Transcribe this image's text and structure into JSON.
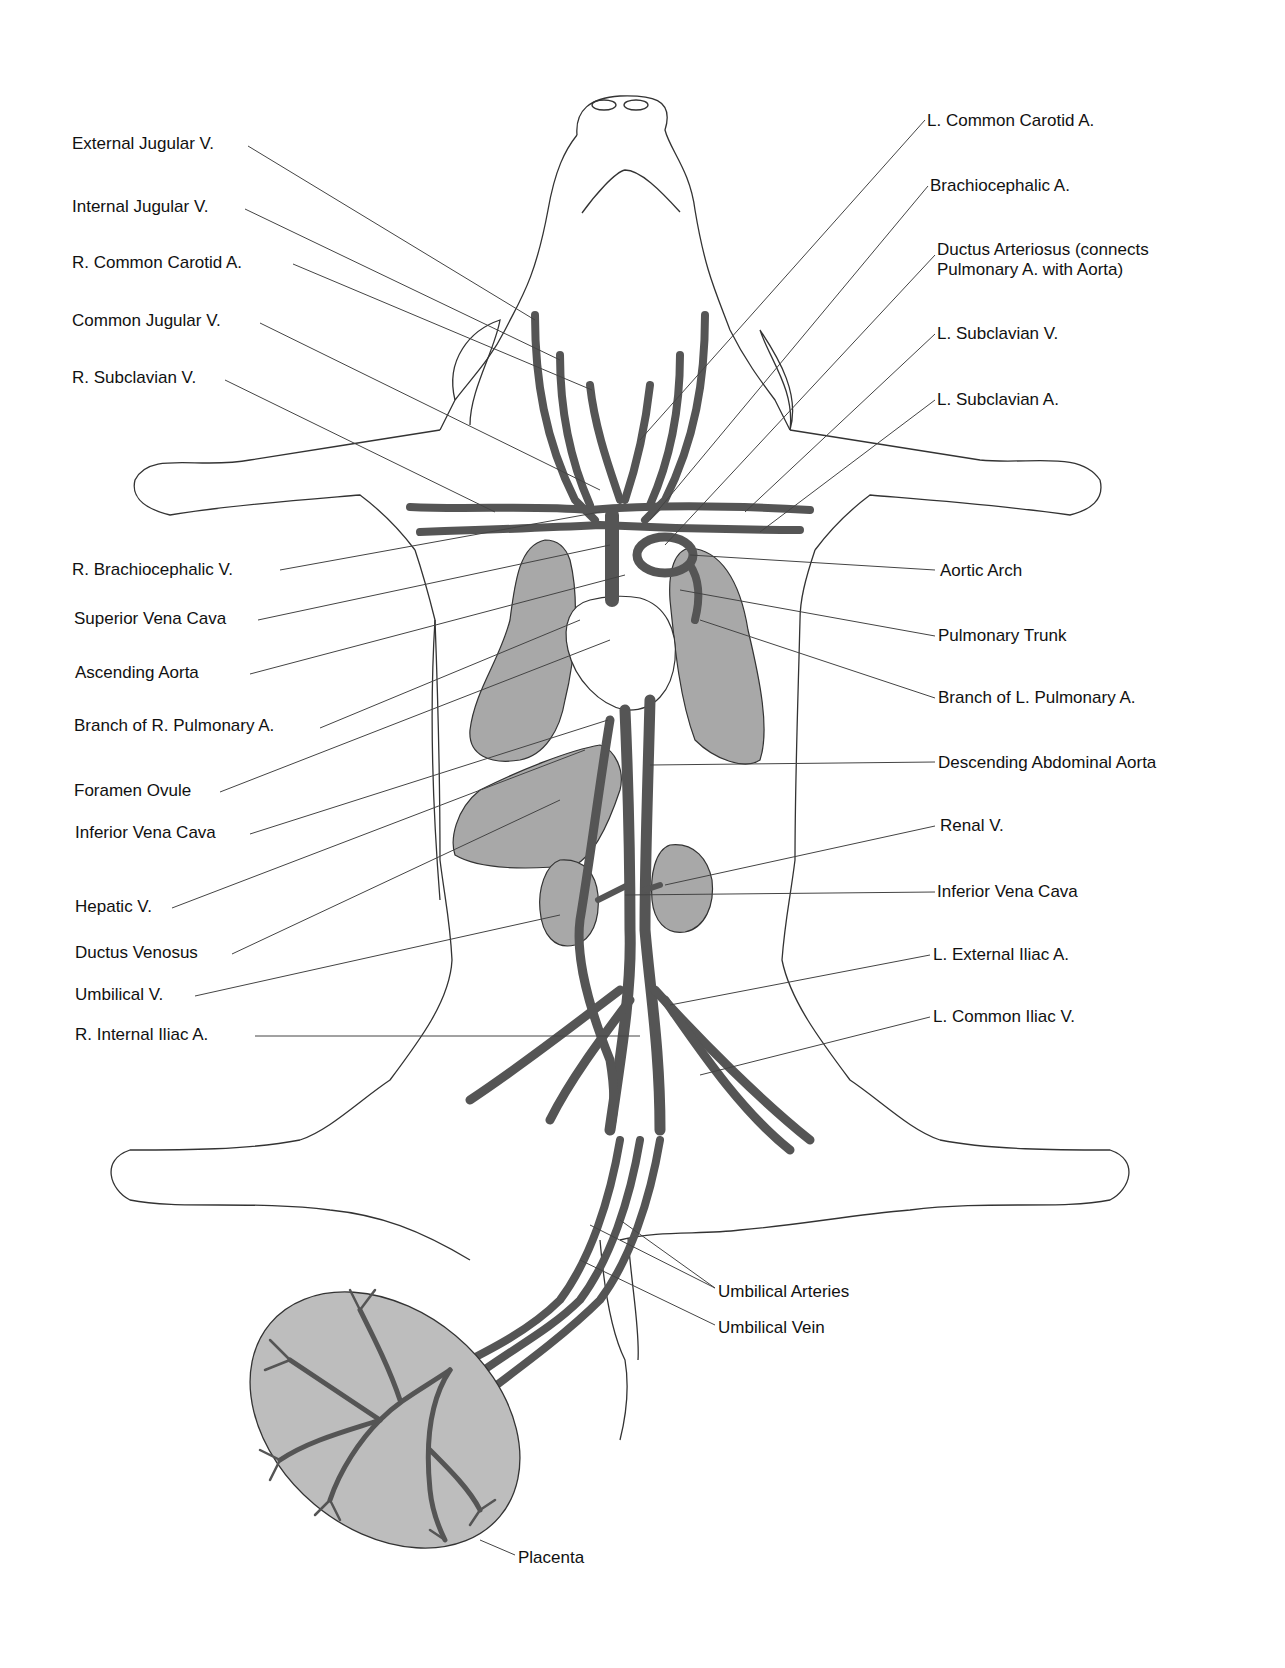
{
  "diagram": {
    "colors": {
      "background": "#ffffff",
      "outline": "#333333",
      "vessel": "#555555",
      "organ_fill": "#a8a8a8",
      "placenta_fill": "#bdbdbd",
      "leader_line": "#444444"
    },
    "labels_left": [
      {
        "id": "external-jugular-v",
        "text": "External Jugular V.",
        "x": 72,
        "y": 134
      },
      {
        "id": "internal-jugular-v",
        "text": "Internal Jugular V.",
        "x": 72,
        "y": 197
      },
      {
        "id": "r-common-carotid-a",
        "text": "R. Common Carotid A.",
        "x": 72,
        "y": 253
      },
      {
        "id": "common-jugular-v",
        "text": "Common Jugular V.",
        "x": 72,
        "y": 311
      },
      {
        "id": "r-subclavian-v",
        "text": "R. Subclavian V.",
        "x": 72,
        "y": 368
      },
      {
        "id": "r-brachiocephalic-v",
        "text": "R. Brachiocephalic V.",
        "x": 72,
        "y": 560
      },
      {
        "id": "superior-vena-cava",
        "text": "Superior Vena Cava",
        "x": 74,
        "y": 609
      },
      {
        "id": "ascending-aorta",
        "text": "Ascending Aorta",
        "x": 75,
        "y": 663
      },
      {
        "id": "branch-r-pulmonary-a",
        "text": "Branch of R. Pulmonary A.",
        "x": 74,
        "y": 716
      },
      {
        "id": "foramen-ovule",
        "text": "Foramen Ovule",
        "x": 74,
        "y": 781
      },
      {
        "id": "inferior-vena-cava-left",
        "text": "Inferior Vena Cava",
        "x": 75,
        "y": 823
      },
      {
        "id": "hepatic-v",
        "text": "Hepatic V.",
        "x": 75,
        "y": 897
      },
      {
        "id": "ductus-venosus",
        "text": "Ductus Venosus",
        "x": 75,
        "y": 943
      },
      {
        "id": "umbilical-v",
        "text": "Umbilical V.",
        "x": 75,
        "y": 985
      },
      {
        "id": "r-internal-iliac-a",
        "text": "R. Internal Iliac A.",
        "x": 75,
        "y": 1025
      }
    ],
    "labels_right": [
      {
        "id": "l-common-carotid-a",
        "text": "L. Common Carotid A.",
        "x": 927,
        "y": 111
      },
      {
        "id": "brachiocephalic-a",
        "text": "Brachiocephalic A.",
        "x": 930,
        "y": 176
      },
      {
        "id": "ductus-arteriosus",
        "text": "Ductus Arteriosus (connects Pulmonary A. with Aorta)",
        "x": 937,
        "y": 240
      },
      {
        "id": "l-subclavian-v",
        "text": "L. Subclavian V.",
        "x": 937,
        "y": 324
      },
      {
        "id": "l-subclavian-a",
        "text": "L. Subclavian A.",
        "x": 937,
        "y": 390
      },
      {
        "id": "aortic-arch",
        "text": "Aortic Arch",
        "x": 940,
        "y": 561
      },
      {
        "id": "pulmonary-trunk",
        "text": "Pulmonary Trunk",
        "x": 938,
        "y": 626
      },
      {
        "id": "branch-l-pulmonary-a",
        "text": "Branch of L. Pulmonary A.",
        "x": 938,
        "y": 688
      },
      {
        "id": "descending-abdominal-aorta",
        "text": "Descending Abdominal Aorta",
        "x": 938,
        "y": 753
      },
      {
        "id": "renal-v",
        "text": "Renal V.",
        "x": 940,
        "y": 816
      },
      {
        "id": "inferior-vena-cava-right",
        "text": "Inferior Vena Cava",
        "x": 937,
        "y": 882
      },
      {
        "id": "l-external-iliac-a",
        "text": "L. External Iliac A.",
        "x": 933,
        "y": 945
      },
      {
        "id": "l-common-iliac-v",
        "text": "L. Common Iliac V.",
        "x": 933,
        "y": 1007
      }
    ],
    "labels_bottom": [
      {
        "id": "umbilical-arteries",
        "text": "Umbilical Arteries",
        "x": 718,
        "y": 1282
      },
      {
        "id": "umbilical-vein",
        "text": "Umbilical Vein",
        "x": 718,
        "y": 1318
      },
      {
        "id": "placenta",
        "text": "Placenta",
        "x": 518,
        "y": 1548
      }
    ]
  }
}
